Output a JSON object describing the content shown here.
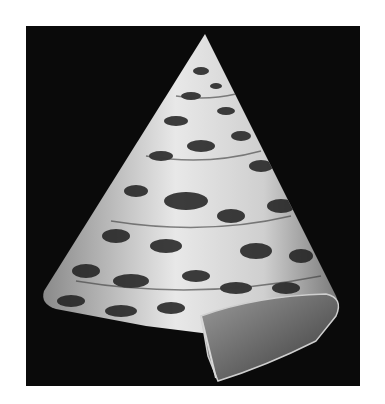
{
  "image": {
    "subject": "conical top shell (seashell) photographed on black background",
    "background_color": "#0a0a0a",
    "page_color": "#ffffff",
    "shell_colors": [
      "#f2f2f2",
      "#bdbdbd",
      "#5a5a5a",
      "#1a1a1a"
    ]
  }
}
